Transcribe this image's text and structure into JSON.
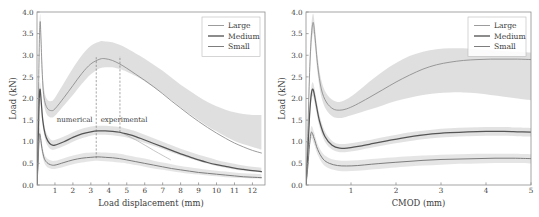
{
  "figure": {
    "background": "#ffffff",
    "panel_count": 2
  },
  "chart_data": [
    {
      "type": "line",
      "panel": "left",
      "title": "",
      "xlabel": "Load displacement (mm)",
      "ylabel": "Load (kN)",
      "xlim": [
        0,
        12.7
      ],
      "ylim": [
        0.0,
        4.0
      ],
      "xticks": [
        1,
        2,
        3,
        4,
        5,
        6,
        7,
        8,
        9,
        10,
        11,
        12
      ],
      "xtick_labels": [
        "1",
        "2",
        "3",
        "4",
        "5",
        "6",
        "7",
        "8",
        "9",
        "10",
        "11",
        "12"
      ],
      "yticks": [
        0.0,
        0.5,
        1.0,
        1.5,
        2.0,
        2.5,
        3.0,
        3.5,
        4.0
      ],
      "ytick_labels": [
        "0.0",
        "0.5",
        "1.0",
        "1.5",
        "2.0",
        "2.5",
        "3.0",
        "3.5",
        "4.0"
      ],
      "grid": false,
      "legend_position": "upper right",
      "legend_entries": [
        "Large",
        "Medium",
        "Small"
      ],
      "annotations": [
        {
          "text": "numerical",
          "x": 2.1,
          "y": 1.45
        },
        {
          "text": "experimental",
          "x": 4.85,
          "y": 1.45
        }
      ],
      "series": [
        {
          "name": "Large",
          "color": "#8a8a8a",
          "band_color": "#d4d4d4",
          "x": [
            0.0,
            0.05,
            0.1,
            0.14,
            0.18,
            0.22,
            0.28,
            0.35,
            0.45,
            0.6,
            0.8,
            1.0,
            1.5,
            2.0,
            2.5,
            3.0,
            3.5,
            3.8,
            4.2,
            4.6,
            5.0,
            5.5,
            6.0,
            6.5,
            7.0,
            7.5,
            8.0,
            8.5,
            9.0,
            9.5,
            10.0,
            10.5,
            11.0,
            11.5,
            12.0,
            12.5
          ],
          "y": [
            0.0,
            1.1,
            2.55,
            3.45,
            3.78,
            3.4,
            2.7,
            2.18,
            1.9,
            1.76,
            1.72,
            1.76,
            2.02,
            2.3,
            2.58,
            2.8,
            2.91,
            2.92,
            2.88,
            2.8,
            2.7,
            2.56,
            2.42,
            2.27,
            2.11,
            1.94,
            1.78,
            1.62,
            1.47,
            1.33,
            1.2,
            1.08,
            0.97,
            0.88,
            0.8,
            0.74
          ],
          "band_lo": [
            0.0,
            0.95,
            2.3,
            3.2,
            3.58,
            3.2,
            2.5,
            2.0,
            1.74,
            1.6,
            1.56,
            1.6,
            1.84,
            2.08,
            2.34,
            2.56,
            2.7,
            2.72,
            2.72,
            2.68,
            2.62,
            2.52,
            2.4,
            2.26,
            2.12,
            1.96,
            1.8,
            1.64,
            1.5,
            1.36,
            1.24,
            1.12,
            1.02,
            0.94,
            0.88,
            0.82
          ],
          "band_hi": [
            0.0,
            1.25,
            2.8,
            3.7,
            3.95,
            3.62,
            2.92,
            2.4,
            2.1,
            1.96,
            1.94,
            2.02,
            2.36,
            2.7,
            3.0,
            3.22,
            3.32,
            3.32,
            3.3,
            3.24,
            3.16,
            3.04,
            2.92,
            2.78,
            2.64,
            2.48,
            2.32,
            2.18,
            2.04,
            1.92,
            1.82,
            1.74,
            1.68,
            1.64,
            1.62,
            1.62
          ]
        },
        {
          "name": "Medium",
          "color": "#555555",
          "band_color": "#d8d8d8",
          "x": [
            0.0,
            0.05,
            0.1,
            0.14,
            0.18,
            0.24,
            0.32,
            0.45,
            0.6,
            0.8,
            1.0,
            1.5,
            2.0,
            2.5,
            3.0,
            3.4,
            3.8,
            4.2,
            4.6,
            5.0,
            5.5,
            6.0,
            6.5,
            7.0,
            7.5,
            8.0,
            8.5,
            9.0,
            9.5,
            10.0,
            10.5,
            11.0,
            11.5,
            12.0,
            12.5
          ],
          "y": [
            0.0,
            0.7,
            1.6,
            2.12,
            2.2,
            1.9,
            1.5,
            1.18,
            1.02,
            0.93,
            0.92,
            1.0,
            1.1,
            1.18,
            1.23,
            1.25,
            1.25,
            1.24,
            1.22,
            1.18,
            1.12,
            1.04,
            0.96,
            0.88,
            0.8,
            0.72,
            0.65,
            0.58,
            0.52,
            0.47,
            0.43,
            0.39,
            0.36,
            0.33,
            0.31
          ],
          "band_lo": [
            0.0,
            0.6,
            1.46,
            1.96,
            2.04,
            1.74,
            1.36,
            1.06,
            0.9,
            0.82,
            0.82,
            0.9,
            1.0,
            1.08,
            1.14,
            1.16,
            1.16,
            1.15,
            1.13,
            1.1,
            1.04,
            0.97,
            0.9,
            0.83,
            0.75,
            0.68,
            0.61,
            0.55,
            0.49,
            0.44,
            0.4,
            0.36,
            0.33,
            0.31,
            0.29
          ],
          "band_hi": [
            0.0,
            0.8,
            1.74,
            2.28,
            2.36,
            2.06,
            1.64,
            1.3,
            1.14,
            1.04,
            1.04,
            1.12,
            1.22,
            1.3,
            1.35,
            1.37,
            1.37,
            1.36,
            1.34,
            1.3,
            1.24,
            1.16,
            1.08,
            1.0,
            0.92,
            0.84,
            0.77,
            0.7,
            0.64,
            0.58,
            0.53,
            0.49,
            0.45,
            0.42,
            0.4
          ]
        },
        {
          "name": "Small",
          "color": "#7d7d7d",
          "band_color": "#dcdcdc",
          "x": [
            0.0,
            0.05,
            0.1,
            0.14,
            0.2,
            0.28,
            0.4,
            0.55,
            0.75,
            1.0,
            1.5,
            2.0,
            2.5,
            3.0,
            3.4,
            3.8,
            4.2,
            4.6,
            5.0,
            5.5,
            6.0,
            6.5,
            7.0,
            7.5,
            8.0,
            8.5,
            9.0,
            9.5,
            10.0,
            10.5,
            11.0,
            11.5,
            12.0,
            12.5
          ],
          "y": [
            0.0,
            0.4,
            0.92,
            1.18,
            1.08,
            0.84,
            0.62,
            0.52,
            0.47,
            0.46,
            0.52,
            0.58,
            0.62,
            0.64,
            0.65,
            0.64,
            0.63,
            0.61,
            0.58,
            0.54,
            0.5,
            0.46,
            0.42,
            0.38,
            0.35,
            0.32,
            0.29,
            0.27,
            0.25,
            0.23,
            0.21,
            0.19,
            0.18,
            0.17
          ],
          "band_lo": [
            0.0,
            0.32,
            0.8,
            1.04,
            0.94,
            0.72,
            0.52,
            0.42,
            0.38,
            0.37,
            0.42,
            0.48,
            0.52,
            0.55,
            0.56,
            0.55,
            0.54,
            0.52,
            0.5,
            0.46,
            0.42,
            0.38,
            0.35,
            0.32,
            0.29,
            0.26,
            0.24,
            0.22,
            0.2,
            0.18,
            0.17,
            0.16,
            0.15,
            0.14
          ],
          "band_hi": [
            0.0,
            0.48,
            1.04,
            1.32,
            1.22,
            0.96,
            0.72,
            0.62,
            0.57,
            0.56,
            0.62,
            0.68,
            0.73,
            0.75,
            0.76,
            0.75,
            0.74,
            0.72,
            0.69,
            0.65,
            0.61,
            0.56,
            0.52,
            0.48,
            0.44,
            0.41,
            0.38,
            0.35,
            0.33,
            0.31,
            0.29,
            0.27,
            0.26,
            0.25
          ]
        }
      ],
      "divider_lines": [
        {
          "x": 3.3,
          "y0": 0.62,
          "y1": 2.96,
          "style": "dashed"
        },
        {
          "x": 4.62,
          "y0": 1.22,
          "y1": 2.98,
          "style": "dashed"
        }
      ],
      "extra_lines": [
        {
          "name": "experimental-softening",
          "x": [
            4.65,
            5.6,
            6.5,
            7.45
          ],
          "y": [
            1.22,
            1.02,
            0.8,
            0.58
          ]
        }
      ]
    },
    {
      "type": "line",
      "panel": "right",
      "title": "",
      "xlabel": "CMOD (mm)",
      "ylabel": "Load (kN)",
      "xlim": [
        0,
        5.0
      ],
      "ylim": [
        0.0,
        4.0
      ],
      "xticks": [
        1,
        2,
        3,
        4,
        5
      ],
      "xtick_labels": [
        "1",
        "2",
        "3",
        "4",
        "5"
      ],
      "yticks": [
        0.0,
        0.5,
        1.0,
        1.5,
        2.0,
        2.5,
        3.0,
        3.5,
        4.0
      ],
      "ytick_labels": [
        "0.0",
        "0.5",
        "1.0",
        "1.5",
        "2.0",
        "2.5",
        "3.0",
        "3.5",
        "4.0"
      ],
      "grid": false,
      "legend_position": "upper right",
      "legend_entries": [
        "Large",
        "Medium",
        "Small"
      ],
      "annotations": [],
      "series": [
        {
          "name": "Large",
          "color": "#8a8a8a",
          "band_color": "#d4d4d4",
          "x": [
            0.0,
            0.04,
            0.08,
            0.12,
            0.16,
            0.2,
            0.26,
            0.34,
            0.45,
            0.6,
            0.75,
            0.9,
            1.1,
            1.4,
            1.7,
            2.0,
            2.3,
            2.6,
            2.9,
            3.2,
            3.5,
            3.8,
            4.1,
            4.4,
            4.7,
            5.0
          ],
          "y": [
            0.0,
            1.2,
            2.6,
            3.45,
            3.76,
            3.42,
            2.76,
            2.22,
            1.92,
            1.76,
            1.73,
            1.76,
            1.85,
            2.02,
            2.2,
            2.38,
            2.54,
            2.68,
            2.78,
            2.84,
            2.88,
            2.9,
            2.91,
            2.91,
            2.91,
            2.9
          ],
          "band_lo": [
            0.0,
            1.0,
            2.34,
            3.18,
            3.52,
            3.2,
            2.56,
            2.04,
            1.74,
            1.58,
            1.55,
            1.58,
            1.64,
            1.74,
            1.84,
            1.94,
            2.02,
            2.08,
            2.12,
            2.14,
            2.14,
            2.12,
            2.08,
            2.04,
            2.0,
            1.96
          ],
          "band_hi": [
            0.0,
            1.36,
            2.84,
            3.7,
            3.96,
            3.64,
            2.96,
            2.42,
            2.12,
            1.96,
            1.92,
            1.98,
            2.12,
            2.38,
            2.62,
            2.82,
            2.98,
            3.08,
            3.14,
            3.16,
            3.16,
            3.14,
            3.12,
            3.1,
            3.08,
            3.06
          ]
        },
        {
          "name": "Medium",
          "color": "#555555",
          "band_color": "#d8d8d8",
          "x": [
            0.0,
            0.04,
            0.08,
            0.12,
            0.16,
            0.22,
            0.3,
            0.42,
            0.58,
            0.75,
            0.95,
            1.2,
            1.5,
            1.8,
            2.1,
            2.4,
            2.8,
            3.2,
            3.6,
            4.0,
            4.4,
            4.7,
            5.0
          ],
          "y": [
            0.0,
            0.72,
            1.62,
            2.12,
            2.2,
            1.9,
            1.48,
            1.12,
            0.92,
            0.85,
            0.86,
            0.9,
            0.96,
            1.02,
            1.08,
            1.13,
            1.18,
            1.21,
            1.23,
            1.24,
            1.24,
            1.23,
            1.22
          ],
          "band_lo": [
            0.0,
            0.62,
            1.48,
            1.96,
            2.04,
            1.74,
            1.34,
            1.0,
            0.82,
            0.76,
            0.77,
            0.81,
            0.87,
            0.93,
            0.98,
            1.03,
            1.08,
            1.11,
            1.13,
            1.14,
            1.14,
            1.13,
            1.12
          ],
          "band_hi": [
            0.0,
            0.82,
            1.76,
            2.28,
            2.36,
            2.06,
            1.62,
            1.24,
            1.02,
            0.95,
            0.96,
            1.0,
            1.06,
            1.12,
            1.18,
            1.23,
            1.28,
            1.31,
            1.33,
            1.34,
            1.34,
            1.33,
            1.32
          ]
        },
        {
          "name": "Small",
          "color": "#7d7d7d",
          "band_color": "#dcdcdc",
          "x": [
            0.0,
            0.04,
            0.08,
            0.12,
            0.18,
            0.26,
            0.38,
            0.52,
            0.7,
            0.9,
            1.15,
            1.45,
            1.8,
            2.2,
            2.6,
            3.0,
            3.4,
            3.8,
            4.2,
            4.6,
            5.0
          ],
          "y": [
            0.0,
            0.42,
            0.94,
            1.22,
            1.08,
            0.82,
            0.6,
            0.5,
            0.45,
            0.44,
            0.45,
            0.48,
            0.51,
            0.54,
            0.57,
            0.59,
            0.6,
            0.61,
            0.62,
            0.62,
            0.61
          ],
          "band_lo": [
            0.0,
            0.32,
            0.82,
            1.08,
            0.94,
            0.7,
            0.48,
            0.38,
            0.33,
            0.32,
            0.33,
            0.36,
            0.39,
            0.42,
            0.45,
            0.47,
            0.49,
            0.5,
            0.51,
            0.51,
            0.5
          ],
          "band_hi": [
            0.0,
            0.52,
            1.06,
            1.36,
            1.22,
            0.94,
            0.72,
            0.62,
            0.57,
            0.56,
            0.57,
            0.6,
            0.63,
            0.66,
            0.68,
            0.7,
            0.71,
            0.72,
            0.72,
            0.72,
            0.71
          ]
        }
      ],
      "divider_lines": [],
      "extra_lines": []
    }
  ]
}
